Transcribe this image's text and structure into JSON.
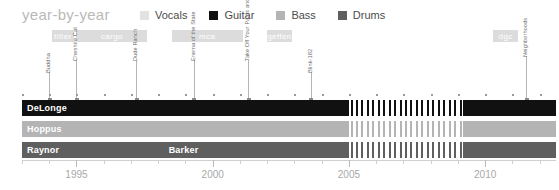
{
  "header": {
    "title": "year-by-year",
    "legend": [
      {
        "label": "Vocals",
        "color": "#e2e2e2",
        "name": "vocals"
      },
      {
        "label": "Guitar",
        "color": "#111111",
        "name": "guitar"
      },
      {
        "label": "Bass",
        "color": "#b4b4b4",
        "name": "bass"
      },
      {
        "label": "Drums",
        "color": "#5f5f5f",
        "name": "drums"
      }
    ]
  },
  "axis": {
    "start_year": 1993,
    "end_year": 2012.6,
    "major_labels": [
      "1995",
      "2000",
      "2005",
      "2010"
    ],
    "major_years": [
      1995,
      2000,
      2005,
      2010
    ],
    "tick_years": [
      1993,
      1994,
      1995,
      1996,
      1997,
      1998,
      1999,
      2000,
      2001,
      2002,
      2003,
      2004,
      2005,
      2006,
      2007,
      2008,
      2009,
      2010,
      2011,
      2012
    ]
  },
  "labels": [
    {
      "name": "filter",
      "text": "filter",
      "start": 1994.1,
      "end": 1994.9
    },
    {
      "name": "cargo",
      "text": "cargo",
      "start": 1995.0,
      "end": 1997.6
    },
    {
      "name": "mca",
      "text": "mca",
      "start": 1998.5,
      "end": 2001.1
    },
    {
      "name": "geffen",
      "text": "geffen",
      "start": 2002.0,
      "end": 2002.9
    },
    {
      "name": "dgc",
      "text": "dgc",
      "start": 2010.3,
      "end": 2011.2
    }
  ],
  "albums": [
    {
      "title": "Buddha",
      "year": 1994.0,
      "stem": 28
    },
    {
      "title": "Cheshire Cat",
      "year": 1995.0,
      "stem": 40
    },
    {
      "title": "Dude Ranch",
      "year": 1997.2,
      "stem": 40
    },
    {
      "title": "Enema of the State",
      "year": 1999.3,
      "stem": 40
    },
    {
      "title": "Take Off Your Pants and Jacket",
      "year": 2001.3,
      "stem": 40
    },
    {
      "title": "Blink-182",
      "year": 2003.6,
      "stem": 28
    },
    {
      "title": "Neighborhoods",
      "year": 2011.5,
      "stem": 44
    }
  ],
  "rows": [
    {
      "name": "delonge",
      "role": "Guitar",
      "color": "#111111",
      "text_color": "#ffffff",
      "segments": [
        {
          "label": "DeLonge",
          "start": 1993.0,
          "end": 2005.0
        },
        {
          "label": "",
          "start": 2009.2,
          "end": 2012.6
        }
      ],
      "hatch": {
        "start": 2005.0,
        "end": 2009.2,
        "color": "#111111"
      }
    },
    {
      "name": "hoppus",
      "role": "Bass",
      "color": "#b4b4b4",
      "text_color": "#ffffff",
      "segments": [
        {
          "label": "Hoppus",
          "start": 1993.0,
          "end": 2005.0
        },
        {
          "label": "",
          "start": 2009.2,
          "end": 2012.6
        }
      ],
      "hatch": {
        "start": 2005.0,
        "end": 2009.2,
        "color": "#b4b4b4"
      }
    },
    {
      "name": "drummers",
      "role": "Drums",
      "color": "#5f5f5f",
      "text_color": "#ffffff",
      "segments": [
        {
          "label": "Raynor",
          "start": 1993.0,
          "end": 1998.2
        },
        {
          "label": "Barker",
          "start": 1998.2,
          "end": 2005.0
        },
        {
          "label": "",
          "start": 2009.2,
          "end": 2012.6
        }
      ],
      "hatch": {
        "start": 2005.0,
        "end": 2009.2,
        "color": "#5f5f5f"
      }
    }
  ]
}
